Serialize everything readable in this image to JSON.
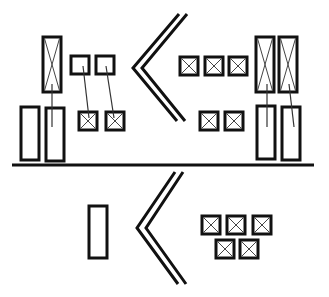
{
  "diagram": {
    "colors": {
      "stroke": "#111111",
      "background": "#ffffff"
    },
    "ground_line": {
      "x1": 12,
      "y1": 165,
      "x2": 314,
      "y2": 165
    },
    "top_section": {
      "chevron": {
        "outer": [
          [
            179,
            14
          ],
          [
            133,
            68
          ],
          [
            177,
            121
          ]
        ],
        "inner": [
          [
            187,
            14
          ],
          [
            142,
            68
          ],
          [
            185,
            121
          ]
        ]
      },
      "left_group": {
        "crossed_tall": [
          {
            "x": 43,
            "y": 37,
            "w": 18,
            "h": 55
          }
        ],
        "plain_tall": [
          {
            "x": 21,
            "y": 107,
            "w": 18,
            "h": 53
          },
          {
            "x": 46,
            "y": 108,
            "w": 18,
            "h": 53
          }
        ],
        "plain_small": [
          {
            "x": 71,
            "y": 56,
            "w": 18,
            "h": 18
          },
          {
            "x": 96,
            "y": 56,
            "w": 18,
            "h": 18
          }
        ],
        "crossed_small": [
          {
            "x": 79,
            "y": 112,
            "w": 18,
            "h": 18
          },
          {
            "x": 106,
            "y": 112,
            "w": 18,
            "h": 18
          }
        ],
        "leaders": [
          [
            [
              52,
              84
            ],
            [
              52,
              127
            ]
          ],
          [
            [
              83,
              66
            ],
            [
              89,
              118
            ]
          ],
          [
            [
              106,
              66
            ],
            [
              114,
              118
            ]
          ]
        ]
      },
      "right_group": {
        "crossed_small": [
          {
            "x": 180,
            "y": 57,
            "w": 18,
            "h": 18
          },
          {
            "x": 205,
            "y": 57,
            "w": 18,
            "h": 18
          },
          {
            "x": 229,
            "y": 57,
            "w": 18,
            "h": 18
          },
          {
            "x": 200,
            "y": 112,
            "w": 18,
            "h": 18
          },
          {
            "x": 225,
            "y": 112,
            "w": 18,
            "h": 18
          }
        ],
        "crossed_tall": [
          {
            "x": 256,
            "y": 37,
            "w": 18,
            "h": 55
          },
          {
            "x": 279,
            "y": 37,
            "w": 18,
            "h": 55
          }
        ],
        "plain_tall": [
          {
            "x": 257,
            "y": 106,
            "w": 18,
            "h": 53
          },
          {
            "x": 282,
            "y": 107,
            "w": 18,
            "h": 53
          }
        ],
        "leaders": [
          [
            [
              267,
              84
            ],
            [
              267,
              127
            ]
          ],
          [
            [
              289,
              84
            ],
            [
              294,
              127
            ]
          ]
        ]
      }
    },
    "bottom_section": {
      "chevron": {
        "outer": [
          [
            175,
            172
          ],
          [
            137,
            228
          ],
          [
            178,
            284
          ]
        ],
        "inner": [
          [
            183,
            172
          ],
          [
            146,
            228
          ],
          [
            186,
            284
          ]
        ]
      },
      "plain_tall": [
        {
          "x": 89,
          "y": 206,
          "w": 18,
          "h": 52
        }
      ],
      "crossed_small": [
        {
          "x": 202,
          "y": 216,
          "w": 18,
          "h": 18
        },
        {
          "x": 227,
          "y": 216,
          "w": 18,
          "h": 18
        },
        {
          "x": 253,
          "y": 216,
          "w": 18,
          "h": 18
        },
        {
          "x": 216,
          "y": 240,
          "w": 18,
          "h": 18
        },
        {
          "x": 240,
          "y": 240,
          "w": 18,
          "h": 18
        }
      ]
    }
  }
}
